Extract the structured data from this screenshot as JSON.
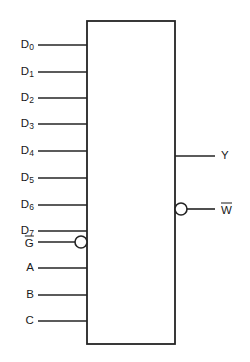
{
  "diagram": {
    "kind": "logic-symbol",
    "component_body": {
      "shape": "rectangle",
      "x": 87,
      "y": 21,
      "width": 88,
      "height": 323,
      "fill_color": "#ffffff",
      "stroke_color": "#242424",
      "interior_text": ""
    },
    "canvas": {
      "width": 250,
      "height": 362,
      "background_color": "#ffffff",
      "line_color": "#242424",
      "text_color": "#1a1a1a"
    },
    "inputs": [
      {
        "id": "d0",
        "label": "D",
        "subscript": "0",
        "overbar": false,
        "bubble": false,
        "y": 45,
        "wire_x_start": 38,
        "wire_x_end": 87,
        "label_x": 34
      },
      {
        "id": "d1",
        "label": "D",
        "subscript": "1",
        "overbar": false,
        "bubble": false,
        "y": 72,
        "wire_x_start": 38,
        "wire_x_end": 87,
        "label_x": 34
      },
      {
        "id": "d2",
        "label": "D",
        "subscript": "2",
        "overbar": false,
        "bubble": false,
        "y": 98,
        "wire_x_start": 38,
        "wire_x_end": 87,
        "label_x": 34
      },
      {
        "id": "d3",
        "label": "D",
        "subscript": "3",
        "overbar": false,
        "bubble": false,
        "y": 124,
        "wire_x_start": 38,
        "wire_x_end": 87,
        "label_x": 34
      },
      {
        "id": "d4",
        "label": "D",
        "subscript": "4",
        "overbar": false,
        "bubble": false,
        "y": 151,
        "wire_x_start": 38,
        "wire_x_end": 87,
        "label_x": 34
      },
      {
        "id": "d5",
        "label": "D",
        "subscript": "5",
        "overbar": false,
        "bubble": false,
        "y": 178,
        "wire_x_start": 38,
        "wire_x_end": 87,
        "label_x": 34
      },
      {
        "id": "d6",
        "label": "D",
        "subscript": "6",
        "overbar": false,
        "bubble": false,
        "y": 205,
        "wire_x_start": 38,
        "wire_x_end": 87,
        "label_x": 34
      },
      {
        "id": "d7",
        "label": "D",
        "subscript": "7",
        "overbar": false,
        "bubble": false,
        "y": 231,
        "wire_x_start": 38,
        "wire_x_end": 87,
        "label_x": 34
      },
      {
        "id": "g",
        "label": "G",
        "subscript": "",
        "overbar": true,
        "bubble": true,
        "y": 242,
        "wire_x_start": 38,
        "wire_x_end": 75,
        "label_x": 34
      },
      {
        "id": "a",
        "label": "A",
        "subscript": "",
        "overbar": false,
        "bubble": false,
        "y": 268,
        "wire_x_start": 38,
        "wire_x_end": 87,
        "label_x": 34
      },
      {
        "id": "b",
        "label": "B",
        "subscript": "",
        "overbar": false,
        "bubble": false,
        "y": 295,
        "wire_x_start": 38,
        "wire_x_end": 87,
        "label_x": 34
      },
      {
        "id": "c",
        "label": "C",
        "subscript": "",
        "overbar": false,
        "bubble": false,
        "y": 321,
        "wire_x_start": 38,
        "wire_x_end": 87,
        "label_x": 34
      }
    ],
    "outputs": [
      {
        "id": "y",
        "label": "Y",
        "subscript": "",
        "overbar": false,
        "bubble": false,
        "y": 156,
        "wire_x_start": 175,
        "wire_x_end": 215,
        "label_x": 221
      },
      {
        "id": "w",
        "label": "W",
        "subscript": "",
        "overbar": true,
        "bubble": true,
        "y": 209,
        "wire_x_start": 187,
        "wire_x_end": 215,
        "label_x": 221
      }
    ],
    "bubbles": [
      {
        "id": "g-bubble",
        "cx": 81,
        "cy": 242,
        "r": 6
      },
      {
        "id": "w-bubble",
        "cx": 181,
        "cy": 209,
        "r": 6
      }
    ]
  }
}
